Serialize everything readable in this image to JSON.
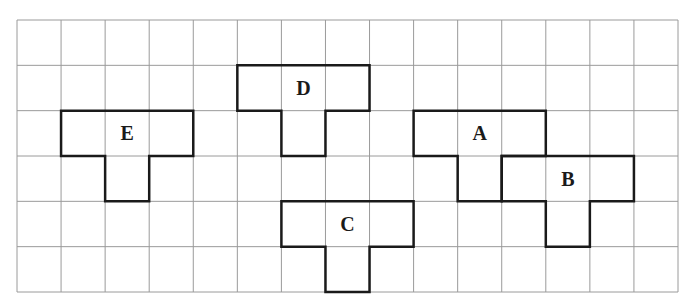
{
  "grid": {
    "columns": 15,
    "rows": 6,
    "origin_x": 17,
    "origin_y": 20,
    "width": 661,
    "height": 272,
    "line_color": "#9a9a9a",
    "outline_color": "#1a1a1a"
  },
  "shapes": [
    {
      "label": "D",
      "cells": [
        [
          5,
          1
        ],
        [
          6,
          1
        ],
        [
          7,
          1
        ],
        [
          6,
          2
        ]
      ]
    },
    {
      "label": "E",
      "cells": [
        [
          1,
          2
        ],
        [
          2,
          2
        ],
        [
          3,
          2
        ],
        [
          2,
          3
        ]
      ]
    },
    {
      "label": "A",
      "cells": [
        [
          9,
          2
        ],
        [
          10,
          2
        ],
        [
          11,
          2
        ],
        [
          10,
          3
        ]
      ]
    },
    {
      "label": "B",
      "cells": [
        [
          11,
          3
        ],
        [
          12,
          3
        ],
        [
          13,
          3
        ],
        [
          12,
          4
        ]
      ]
    },
    {
      "label": "C",
      "cells": [
        [
          6,
          4
        ],
        [
          7,
          4
        ],
        [
          8,
          4
        ],
        [
          7,
          5
        ]
      ]
    }
  ]
}
